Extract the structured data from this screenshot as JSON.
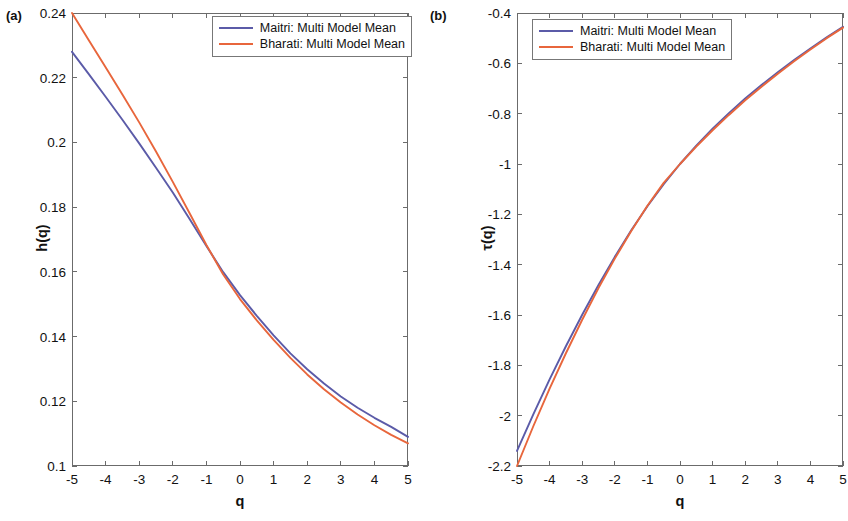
{
  "figure": {
    "panels": [
      {
        "tag": "(a)",
        "xlabel": "q",
        "ylabel": "h(q)",
        "xticks": [
          "-5",
          "-4",
          "-3",
          "-2",
          "-1",
          "0",
          "1",
          "2",
          "3",
          "4",
          "5"
        ],
        "yticks": [
          "0.1",
          "0.12",
          "0.14",
          "0.16",
          "0.18",
          "0.2",
          "0.22",
          "0.24"
        ]
      },
      {
        "tag": "(b)",
        "xlabel": "q",
        "ylabel": "τ(q)",
        "xticks": [
          "-5",
          "-4",
          "-3",
          "-2",
          "-1",
          "0",
          "1",
          "2",
          "3",
          "4",
          "5"
        ],
        "yticks": [
          "-2.2",
          "-2",
          "-1.8",
          "-1.6",
          "-1.4",
          "-1.2",
          "-1",
          "-0.8",
          "-0.6",
          "-0.4"
        ]
      }
    ],
    "legend": {
      "entries": [
        {
          "label": "Maitri: Multi Model Mean",
          "color": "#5b5ba8"
        },
        {
          "label": "Bharati: Multi Model Mean",
          "color": "#e8663c"
        }
      ]
    },
    "colors": {
      "maitri": "#5b5ba8",
      "bharati": "#e8663c",
      "axis": "#6b6b6b",
      "background": "#ffffff"
    }
  },
  "chart_data": [
    {
      "type": "line",
      "panel": "(a)",
      "title": "",
      "xlabel": "q",
      "ylabel": "h(q)",
      "xlim": [
        -5,
        5
      ],
      "ylim": [
        0.1,
        0.24
      ],
      "xticks": [
        -5,
        -4,
        -3,
        -2,
        -1,
        0,
        1,
        2,
        3,
        4,
        5
      ],
      "yticks": [
        0.1,
        0.12,
        0.14,
        0.16,
        0.18,
        0.2,
        0.22,
        0.24
      ],
      "grid": false,
      "legend_position": "top-right",
      "x": [
        -5,
        -4.5,
        -4,
        -3.5,
        -3,
        -2.5,
        -2,
        -1.5,
        -1,
        -0.5,
        0,
        0.5,
        1,
        1.5,
        2,
        2.5,
        3,
        3.5,
        4,
        4.5,
        5
      ],
      "series": [
        {
          "name": "Maitri: Multi Model Mean",
          "color": "#5b5ba8",
          "values": [
            0.228,
            0.2211,
            0.2141,
            0.207,
            0.1997,
            0.1922,
            0.1845,
            0.1763,
            0.168,
            0.1599,
            0.1528,
            0.1464,
            0.1404,
            0.1348,
            0.1299,
            0.1255,
            0.1215,
            0.118,
            0.1149,
            0.1121,
            0.109
          ]
        },
        {
          "name": "Bharati: Multi Model Mean",
          "color": "#e8663c",
          "values": [
            0.24,
            0.2316,
            0.2232,
            0.2148,
            0.2062,
            0.1972,
            0.1878,
            0.1781,
            0.1683,
            0.1592,
            0.1516,
            0.145,
            0.139,
            0.1334,
            0.1283,
            0.1237,
            0.1196,
            0.1159,
            0.1126,
            0.1096,
            0.107
          ]
        }
      ]
    },
    {
      "type": "line",
      "panel": "(b)",
      "title": "",
      "xlabel": "q",
      "ylabel": "τ(q)",
      "xlim": [
        -5,
        5
      ],
      "ylim": [
        -2.2,
        -0.4
      ],
      "xticks": [
        -5,
        -4,
        -3,
        -2,
        -1,
        0,
        1,
        2,
        3,
        4,
        5
      ],
      "yticks": [
        -2.2,
        -2.0,
        -1.8,
        -1.6,
        -1.4,
        -1.2,
        -1.0,
        -0.8,
        -0.6,
        -0.4
      ],
      "grid": false,
      "legend_position": "top-left",
      "x": [
        -5,
        -4.5,
        -4,
        -3.5,
        -3,
        -2.5,
        -2,
        -1.5,
        -1,
        -0.5,
        0,
        0.5,
        1,
        1.5,
        2,
        2.5,
        3,
        3.5,
        4,
        4.5,
        5
      ],
      "series": [
        {
          "name": "Maitri: Multi Model Mean",
          "color": "#5b5ba8",
          "values": [
            -2.14,
            -1.995,
            -1.856,
            -1.724,
            -1.599,
            -1.481,
            -1.369,
            -1.264,
            -1.168,
            -1.08,
            -1.0,
            -0.927,
            -0.86,
            -0.798,
            -0.74,
            -0.686,
            -0.635,
            -0.587,
            -0.541,
            -0.497,
            -0.455
          ]
        },
        {
          "name": "Bharati: Multi Model Mean",
          "color": "#e8663c",
          "values": [
            -2.2,
            -2.042,
            -1.893,
            -1.752,
            -1.619,
            -1.493,
            -1.376,
            -1.267,
            -1.166,
            -1.075,
            -1.0,
            -0.931,
            -0.866,
            -0.805,
            -0.747,
            -0.693,
            -0.641,
            -0.592,
            -0.545,
            -0.5,
            -0.458
          ]
        }
      ]
    }
  ]
}
